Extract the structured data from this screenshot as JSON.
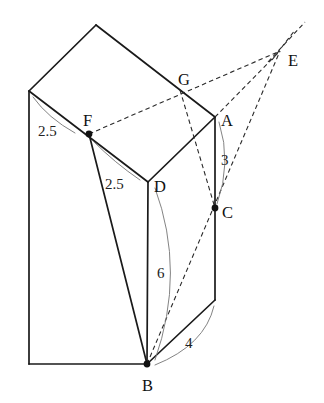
{
  "figure": {
    "type": "geometry-diagram",
    "canvas": {
      "width": 324,
      "height": 403
    },
    "stroke_color": "#1a1a1a",
    "dash_color": "#2a2a2a",
    "arc_color": "#7c7c7c",
    "background": "#ffffff"
  },
  "vertices": [
    {
      "id": "A",
      "label": "A",
      "x": 215,
      "y": 117,
      "label_x": 221,
      "label_y": 126,
      "dot": false
    },
    {
      "id": "B",
      "label": "B",
      "x": 147,
      "y": 364,
      "label_x": 142,
      "label_y": 391,
      "dot": true
    },
    {
      "id": "C",
      "label": "C",
      "x": 215,
      "y": 208,
      "label_x": 222,
      "label_y": 218,
      "dot": true
    },
    {
      "id": "D",
      "label": "D",
      "x": 148,
      "y": 182,
      "label_x": 154,
      "label_y": 192,
      "dot": false
    },
    {
      "id": "E",
      "label": "E",
      "x": 280,
      "y": 51,
      "label_x": 288,
      "label_y": 66,
      "dot": false
    },
    {
      "id": "F",
      "label": "F",
      "x": 89,
      "y": 134,
      "label_x": 83,
      "label_y": 126,
      "dot": true
    },
    {
      "id": "G",
      "label": "G",
      "x": 185,
      "y": 95,
      "label_x": 178,
      "label_y": 85,
      "dot": false
    }
  ],
  "measurements": [
    {
      "id": "m-fa",
      "value": "2.5",
      "x": 38,
      "y": 136,
      "segment": "top-left edge to F"
    },
    {
      "id": "m-fd",
      "value": "2.5",
      "x": 105,
      "y": 189,
      "segment": "F to D region"
    },
    {
      "id": "m-ac",
      "value": "3",
      "x": 221,
      "y": 165,
      "segment": "A to C"
    },
    {
      "id": "m-db",
      "value": "6",
      "x": 157,
      "y": 278,
      "segment": "D to B"
    },
    {
      "id": "m-bc-base",
      "value": "4",
      "x": 185,
      "y": 348,
      "segment": "bottom base edge"
    }
  ],
  "edges": {
    "solid": [
      {
        "name": "top-apex-to-left",
        "from": [
          96,
          25
        ],
        "to": [
          29,
          91
        ]
      },
      {
        "name": "top-apex-to-right",
        "from": [
          96,
          25
        ],
        "to": [
          215,
          117
        ]
      },
      {
        "name": "top-left-to-F",
        "from": [
          29,
          91
        ],
        "to": [
          148,
          182
        ]
      },
      {
        "name": "top-right-A-to-D",
        "from": [
          215,
          117
        ],
        "to": [
          148,
          182
        ]
      },
      {
        "name": "left-vertical",
        "from": [
          29,
          91
        ],
        "to": [
          29,
          364
        ]
      },
      {
        "name": "A-vertical-to-base",
        "from": [
          215,
          117
        ],
        "to": [
          215,
          300
        ]
      },
      {
        "name": "D-vertical-to-B",
        "from": [
          148,
          182
        ],
        "to": [
          147,
          364
        ]
      },
      {
        "name": "F-to-B",
        "from": [
          89,
          134
        ],
        "to": [
          147,
          364
        ]
      },
      {
        "name": "bottom-left-to-B",
        "from": [
          29,
          364
        ],
        "to": [
          147,
          364
        ]
      },
      {
        "name": "B-to-base-right",
        "from": [
          147,
          364
        ],
        "to": [
          215,
          300
        ]
      }
    ],
    "dashed": [
      {
        "name": "F-to-E",
        "from": [
          89,
          134
        ],
        "to": [
          280,
          51
        ]
      },
      {
        "name": "G-to-C-extended",
        "from": [
          180,
          90
        ],
        "to": [
          215,
          208
        ]
      },
      {
        "name": "A-to-E",
        "from": [
          215,
          117
        ],
        "to": [
          280,
          51
        ]
      },
      {
        "name": "B-through-C-to-E",
        "from": [
          147,
          364
        ],
        "to": [
          280,
          51
        ]
      },
      {
        "name": "E-ray-upper",
        "from": [
          272,
          60
        ],
        "to": [
          295,
          30
        ]
      },
      {
        "name": "E-ray-far",
        "from": [
          268,
          62
        ],
        "to": [
          305,
          22
        ]
      }
    ]
  },
  "arcs": [
    {
      "name": "arc-2.5-top-left",
      "d": "M 33,97 Q 48,118 75,133"
    },
    {
      "name": "arc-2.5-F-D",
      "d": "M 93,141 Q 115,163 140,180"
    },
    {
      "name": "arc-3-A-C",
      "d": "M 219,122 Q 232,163 217,204"
    },
    {
      "name": "arc-6-D-B",
      "d": "M 155,188 Q 186,272 155,360"
    },
    {
      "name": "arc-4-base",
      "d": "M 214,306 Q 205,345 155,365"
    }
  ]
}
